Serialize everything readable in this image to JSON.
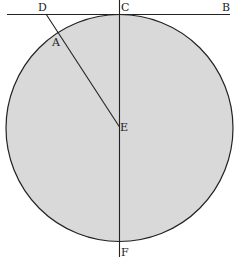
{
  "diagram": {
    "colors": {
      "circle_fill": "#d9d9d9",
      "stroke": "#222222",
      "background": "#ffffff"
    },
    "labels": {
      "A": "A",
      "B": "B",
      "C": "C",
      "D": "D",
      "E": "E",
      "F": "F"
    }
  }
}
